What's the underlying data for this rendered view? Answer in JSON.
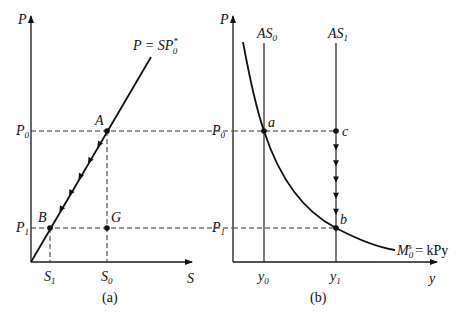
{
  "panel_a": {
    "caption": "(a)",
    "y_axis_label": "P",
    "x_axis_label": "S",
    "curve_label": {
      "main": "P = SP",
      "sub": "0",
      "sup": "*"
    },
    "price_levels": [
      {
        "main": "P",
        "sub": "0"
      },
      {
        "main": "P",
        "sub": "1"
      }
    ],
    "x_ticks": [
      {
        "main": "S",
        "sub": "1"
      },
      {
        "main": "S",
        "sub": "0"
      }
    ],
    "points": [
      {
        "label": "A",
        "role": "initial equilibrium (S0, P0)"
      },
      {
        "label": "B",
        "role": "final equilibrium (S1, P1)"
      },
      {
        "label": "G",
        "role": "(S0, P1)"
      }
    ],
    "arrow_count": 5,
    "arrow_direction": "down along line from A to B"
  },
  "panel_b": {
    "caption": "(b)",
    "y_axis_label": "P",
    "x_axis_label": "y",
    "supply_lines": [
      {
        "main": "AS",
        "sub": "0"
      },
      {
        "main": "AS",
        "sub": "1"
      }
    ],
    "price_levels": [
      {
        "main": "P",
        "sub": "0"
      },
      {
        "main": "P",
        "sub": "1"
      }
    ],
    "x_ticks": [
      {
        "main": "y",
        "sub": "0"
      },
      {
        "main": "y",
        "sub": "1"
      }
    ],
    "curve_label": {
      "main": "M",
      "sub": "0",
      "sup": "s",
      "rest": " = kPy"
    },
    "points": [
      {
        "label": "a",
        "role": "(y0, P0)"
      },
      {
        "label": "c",
        "role": "(y1, P0)"
      },
      {
        "label": "b",
        "role": "(y1, P1)"
      }
    ],
    "arrow_count": 5,
    "arrow_direction": "down along AS1 from c to b"
  }
}
